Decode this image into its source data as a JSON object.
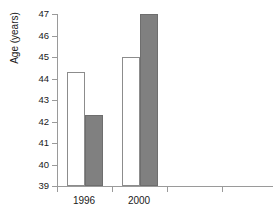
{
  "chart_data": {
    "type": "bar",
    "title": "",
    "subtitle": "",
    "xlabel": "",
    "ylabel": "Age (years)",
    "categories": [
      "1996",
      "2000"
    ],
    "series": [
      {
        "name": "open",
        "values": [
          44.3,
          45.0
        ]
      },
      {
        "name": "filled",
        "values": [
          42.3,
          47.0
        ]
      }
    ],
    "ylim": [
      39,
      47
    ],
    "ytick_labels": [
      "47",
      "46",
      "45",
      "44",
      "43",
      "42",
      "41",
      "40",
      "39"
    ],
    "ytick_values": [
      47,
      46,
      45,
      44,
      43,
      42,
      41,
      40,
      39
    ],
    "xtick_labels": [
      "1996",
      "2000",
      "",
      "",
      ""
    ],
    "grid": false,
    "legend": "none",
    "colors": {
      "open_fill": "#ffffff",
      "open_border": "#8c8c8c",
      "filled_fill": "#808080",
      "filled_border": "#6e6e6e",
      "axis": "#9a9a9a",
      "text": "#1a1a1a",
      "background": "#ffffff"
    }
  }
}
